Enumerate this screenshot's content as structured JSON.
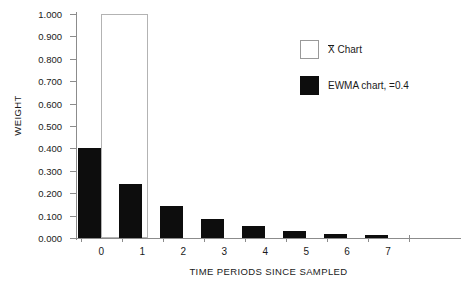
{
  "chart_data": {
    "type": "bar",
    "title": "",
    "xlabel": "TIME PERIODS SINCE SAMPLED",
    "ylabel": "WEIGHT",
    "categories": [
      "0",
      "1",
      "2",
      "3",
      "4",
      "5",
      "6",
      "7"
    ],
    "ylim": [
      0.0,
      1.0
    ],
    "ytick_labels": [
      "0.000",
      "0.100",
      "0.200",
      "0.300",
      "0.400",
      "0.500",
      "0.600",
      "0.700",
      "0.800",
      "0.900",
      "1.000"
    ],
    "ytick_values": [
      0.0,
      0.1,
      0.2,
      0.3,
      0.4,
      0.5,
      0.6,
      0.7,
      0.8,
      0.9,
      1.0
    ],
    "grid": false,
    "legend_position": "upper-right",
    "series": [
      {
        "name": "X̄ Chart",
        "style": "open",
        "color": "#ffffff",
        "edgecolor": "#b3b3b3",
        "values": [
          1.0,
          0,
          0,
          0,
          0,
          0,
          0,
          0
        ]
      },
      {
        "name": "EWMA chart, =0.4",
        "style": "filled",
        "color": "#0d0d0d",
        "values": [
          0.4,
          0.24,
          0.144,
          0.0864,
          0.0518,
          0.0311,
          0.0187,
          0.0112
        ]
      }
    ]
  },
  "legend": {
    "items": [
      {
        "label_prefix": "X",
        "label_suffix": " Chart",
        "full": "X̄ Chart"
      },
      {
        "full": "EWMA chart, =0.4"
      }
    ]
  },
  "axes": {
    "y_label": "WEIGHT",
    "x_label": "TIME PERIODS SINCE SAMPLED"
  }
}
